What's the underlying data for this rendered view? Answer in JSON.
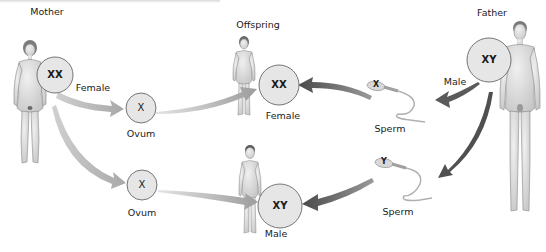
{
  "figure": {
    "title_cropped": "",
    "parents": {
      "mother": {
        "label": "Mother",
        "chromosomes": "XX"
      },
      "father": {
        "label": "Father",
        "chromosomes": "XY"
      }
    },
    "gametes": {
      "ovum_top": {
        "chromosome": "X",
        "label": "Ovum"
      },
      "ovum_bottom": {
        "chromosome": "X",
        "label": "Ovum"
      },
      "sperm_top": {
        "chromosome": "X",
        "label": "Sperm"
      },
      "sperm_bottom": {
        "chromosome": "Y",
        "label": "Sperm"
      }
    },
    "offspring": {
      "label": "Offspring",
      "female": {
        "chromosomes": "XX",
        "label": "Female"
      },
      "male": {
        "chromosomes": "XY",
        "label": "Male"
      }
    },
    "arrow_labels": {
      "mother_to_ovum": "Female",
      "father_to_sperm": "Male"
    }
  },
  "colors": {
    "circle_fill": "#e6e6e6",
    "circle_stroke": "#555555",
    "maternal_arrow": "#b0b0b0",
    "paternal_arrow": "#5a5a5a",
    "skin": "#dcdcdc",
    "text": "#1a1a1a"
  }
}
